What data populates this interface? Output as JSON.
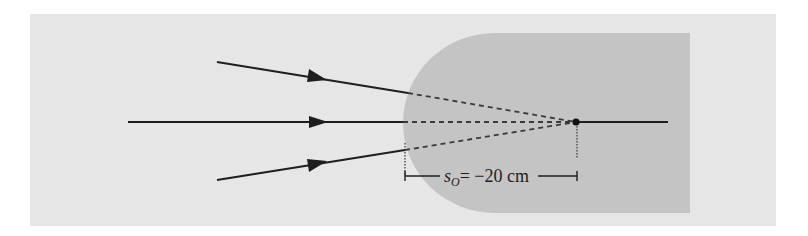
{
  "figure": {
    "type": "refraction-diagram",
    "colors": {
      "page": "#ffffff",
      "panel": "#e6e6e6",
      "glass": "#c4c4c4",
      "ray": "#1e1e1e",
      "dashed": "#3a3a3a"
    },
    "rays": [
      {
        "name": "upper-ray",
        "start": [
          217,
          62
        ],
        "surface_hit": [
          408,
          93
        ],
        "arrow_at": [
          318,
          77
        ]
      },
      {
        "name": "axis-ray",
        "start": [
          128,
          122
        ],
        "surface_hit": [
          403,
          122
        ],
        "arrow_at": [
          318,
          122
        ]
      },
      {
        "name": "lower-ray",
        "start": [
          217,
          180
        ],
        "surface_hit": [
          405,
          150
        ],
        "arrow_at": [
          318,
          164
        ]
      }
    ],
    "virtual_object_point": [
      576,
      122
    ],
    "axis_end_x": 668,
    "dimension": {
      "symbol": "s",
      "subscript": "O",
      "value_text": "= −20 cm",
      "left_x": 405,
      "right_x": 577,
      "y": 176
    }
  }
}
